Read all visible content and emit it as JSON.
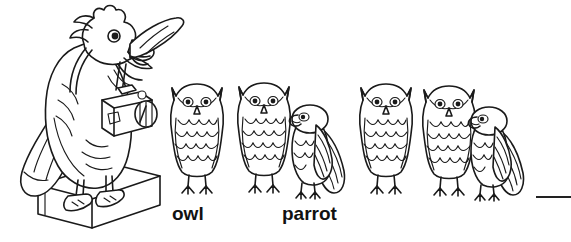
{
  "scene": {
    "title": "Bird photographer illustration worksheet",
    "background_color": "#ffffff",
    "ink_color": "#1a1a1a"
  },
  "photographer": {
    "name": "parrot-photographer",
    "species": "parrot",
    "pose": "standing on block, wing outstretched, holding camera",
    "props": [
      "camera",
      "camera-strap",
      "block"
    ]
  },
  "bird_row": {
    "count": 6,
    "birds": [
      {
        "index": 1,
        "species": "owl",
        "facing": "front"
      },
      {
        "index": 2,
        "species": "owl",
        "facing": "front"
      },
      {
        "index": 3,
        "species": "parrot",
        "facing": "left"
      },
      {
        "index": 4,
        "species": "owl",
        "facing": "front"
      },
      {
        "index": 5,
        "species": "owl",
        "facing": "front"
      },
      {
        "index": 6,
        "species": "parrot",
        "facing": "left"
      }
    ]
  },
  "labels": {
    "owl": "owl",
    "parrot": "parrot"
  },
  "answer_line": {
    "name": "blank-answer-line",
    "value": ""
  }
}
